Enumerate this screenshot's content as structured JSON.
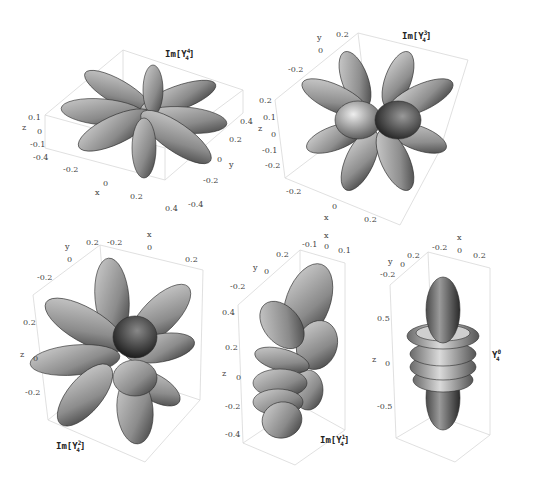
{
  "figure": {
    "panels": [
      {
        "id": "im-y4-4",
        "title": {
          "prefix": "Im[Y",
          "sub": "4",
          "sup": "4",
          "suffix": "]"
        },
        "axes": {
          "z_label": "z",
          "z_ticks": [
            "0.1",
            "0",
            "-0.1"
          ],
          "x_label": "x",
          "x_ticks": [
            "-0.4",
            "-0.2",
            "0",
            "0.2",
            "0.4"
          ],
          "y_label": "y",
          "y_ticks": [
            "0.4",
            "0.2",
            "0",
            "-0.2",
            "-0.4"
          ]
        },
        "lobes": 8
      },
      {
        "id": "im-y4-3",
        "title": {
          "prefix": "Im[Y",
          "sub": "4",
          "sup": "3",
          "suffix": "]"
        },
        "axes": {
          "y_label": "y",
          "y_ticks": [
            "0.2",
            "0",
            "-0.2"
          ],
          "z_label": "z",
          "z_ticks": [
            "0.2",
            "0.1",
            "0",
            "-0.1",
            "-0.2"
          ],
          "x_label": "x",
          "x_ticks": [
            "-0.2",
            "0",
            "0.2"
          ]
        },
        "lobes": 12
      },
      {
        "id": "im-y4-2",
        "title": {
          "prefix": "Im[Y",
          "sub": "4",
          "sup": "2",
          "suffix": "]"
        },
        "axes": {
          "y_label": "y",
          "y_ticks": [
            "0.2",
            "0",
            "-0.2"
          ],
          "x_label": "x",
          "x_ticks": [
            "-0.2",
            "0",
            "0.2"
          ],
          "z_label": "z",
          "z_ticks": [
            "0.2",
            "0",
            "-0.2"
          ]
        },
        "lobes": 12
      },
      {
        "id": "im-y4-1",
        "title": {
          "prefix": "Im[Y",
          "sub": "4",
          "sup": "1",
          "suffix": "]"
        },
        "axes": {
          "x_label": "x",
          "x_ticks": [
            "-0.1",
            "0",
            "0.1"
          ],
          "y_label": "y",
          "y_ticks": [
            "0.2",
            "0",
            "-0.2"
          ],
          "z_label": "z",
          "z_ticks": [
            "0.4",
            "0.2",
            "0",
            "-0.2",
            "-0.4"
          ]
        },
        "lobes": 8
      },
      {
        "id": "y4-0",
        "title": {
          "prefix": "Y",
          "sub": "4",
          "sup": "0",
          "suffix": ""
        },
        "axes": {
          "x_label": "x",
          "x_ticks": [
            "-0.2",
            "0",
            "0.2"
          ],
          "y_label": "y",
          "y_ticks": [
            "0.2",
            "0",
            "-0.2"
          ],
          "z_label": "z",
          "z_ticks": [
            "0.5",
            "0",
            "-0.5"
          ]
        },
        "lobes": 2
      }
    ]
  },
  "colors": {
    "surface": "#9a9a9a",
    "surface_light": "#cfcfcf",
    "surface_dark": "#3a3a3a",
    "mesh": "#2a2a2a",
    "box": "#cfcfcf",
    "text": "#444444"
  }
}
